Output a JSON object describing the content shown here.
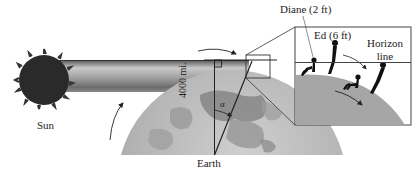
{
  "diagram": {
    "labels": {
      "sun": "Sun",
      "earth": "Earth",
      "radius": "4000 mi.",
      "angle": "α",
      "diane": "Diane (2 ft)",
      "ed": "Ed (6 ft)",
      "horizon": "Horizon line"
    },
    "horizon_line_1": "Horizon",
    "horizon_line_2": "line",
    "colors": {
      "background": "#ffffff",
      "sun": "#2a2a2a",
      "beam_top": "#5a5a5a",
      "beam_mid": "#a8a8a8",
      "earth_base": "#b4b4b4",
      "earth_land": "#8c8c8c",
      "inset_ground": "#a6a6a6",
      "silhouette": "#111111",
      "line": "#222222"
    }
  }
}
